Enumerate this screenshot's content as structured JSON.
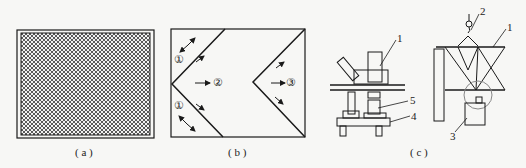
{
  "panels": [
    {
      "id": "a",
      "caption": "( a )"
    },
    {
      "id": "b",
      "caption": "( b )",
      "labels": [
        "①",
        "②",
        "③",
        "①"
      ]
    },
    {
      "id": "c",
      "caption": "( c )",
      "labels": [
        "1",
        "5",
        "4",
        "2",
        "1",
        "3"
      ]
    }
  ],
  "colors": {
    "line": "#1a1a1a",
    "background": "#f7f7f5"
  }
}
